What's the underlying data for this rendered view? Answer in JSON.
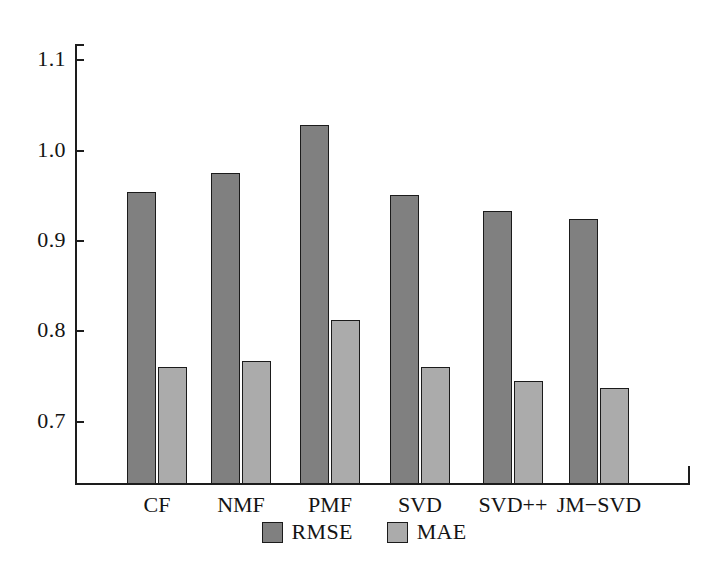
{
  "chart_data": {
    "type": "bar",
    "title": "",
    "subtitle": "",
    "xlabel": "",
    "ylabel": "",
    "categories": [
      "CF",
      "NMF",
      "PMF",
      "SVD",
      "SVD++",
      "JM−SVD"
    ],
    "series": [
      {
        "name": "RMSE",
        "color": "#808080",
        "values": [
          0.954,
          0.975,
          1.028,
          0.951,
          0.933,
          0.924
        ]
      },
      {
        "name": "MAE",
        "color": "#ababab",
        "values": [
          0.76,
          0.767,
          0.813,
          0.76,
          0.745,
          0.737
        ]
      }
    ],
    "ylim": [
      0.631,
      1.118
    ],
    "yticks": [
      0.7,
      0.8,
      0.9,
      1.0,
      1.1
    ],
    "ytick_labels": [
      "0.7",
      "0.8",
      "0.9",
      "1.0",
      "1.1"
    ],
    "grid": false,
    "legend_position": "bottom-center",
    "legend_entries": [
      "RMSE",
      "MAE"
    ],
    "annotations": []
  },
  "axes": {
    "y_axis_name": "value-axis",
    "x_axis_name": "model-axis"
  }
}
